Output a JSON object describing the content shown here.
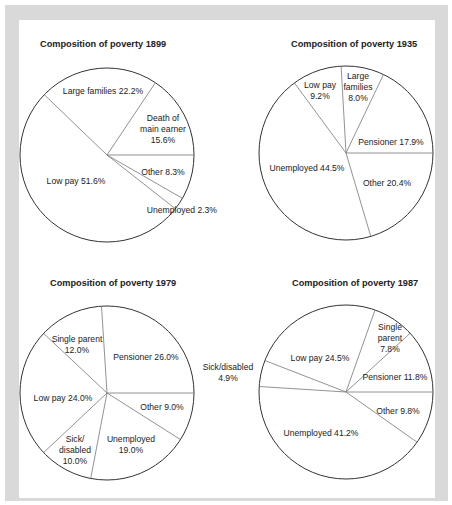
{
  "chart_data": [
    {
      "type": "pie",
      "title": "Composition of poverty 1899",
      "categories": [
        "Death of main earner",
        "Large families",
        "Low pay",
        "Unemployed",
        "Other"
      ],
      "values": [
        15.6,
        22.2,
        51.6,
        2.3,
        8.3
      ],
      "unit": "%",
      "layout": {
        "cx": 107,
        "cy": 155,
        "r": 87,
        "title_x": 40,
        "title_y": 47
      },
      "labels": [
        {
          "lines": [
            "Death of",
            "main earner",
            "15.6%"
          ],
          "x": 163,
          "y": 121
        },
        {
          "lines": [
            "Large families 22.2%"
          ],
          "x": 103,
          "y": 94
        },
        {
          "lines": [
            "Low pay 51.6%"
          ],
          "x": 76,
          "y": 184
        },
        {
          "lines": [
            "Unemployed 2.3%"
          ],
          "x": 217,
          "y": 213,
          "anchor": "end"
        },
        {
          "lines": [
            "Other 8.3%"
          ],
          "x": 163,
          "y": 175
        }
      ]
    },
    {
      "type": "pie",
      "title": "Composition of poverty 1935",
      "categories": [
        "Pensioner",
        "Large families",
        "Low pay",
        "Unemployed",
        "Other"
      ],
      "values": [
        17.9,
        8.0,
        9.2,
        44.5,
        20.4
      ],
      "unit": "%",
      "layout": {
        "cx": 346,
        "cy": 153,
        "r": 87,
        "title_x": 291,
        "title_y": 47
      },
      "labels": [
        {
          "lines": [
            "Pensioner 17.9%"
          ],
          "x": 391,
          "y": 145
        },
        {
          "lines": [
            "Large",
            "families",
            "8.0%"
          ],
          "x": 358,
          "y": 79
        },
        {
          "lines": [
            "Low pay",
            "9.2%"
          ],
          "x": 320,
          "y": 88
        },
        {
          "lines": [
            "Unemployed 44.5%"
          ],
          "x": 307,
          "y": 171
        },
        {
          "lines": [
            "Other 20.4%"
          ],
          "x": 387,
          "y": 186
        }
      ]
    },
    {
      "type": "pie",
      "title": "Composition of poverty 1979",
      "categories": [
        "Pensioner",
        "Single parent",
        "Low pay",
        "Sick/disabled",
        "Unemployed",
        "Other"
      ],
      "values": [
        26.0,
        12.0,
        24.0,
        10.0,
        19.0,
        9.0
      ],
      "unit": "%",
      "layout": {
        "cx": 107,
        "cy": 393,
        "r": 87,
        "title_x": 50,
        "title_y": 286
      },
      "labels": [
        {
          "lines": [
            "Single parent",
            "12.0%"
          ],
          "x": 77,
          "y": 342
        },
        {
          "lines": [
            "Pensioner 26.0%"
          ],
          "x": 146,
          "y": 360
        },
        {
          "lines": [
            "Low pay 24.0%"
          ],
          "x": 63,
          "y": 401
        },
        {
          "lines": [
            "Other 9.0%"
          ],
          "x": 162,
          "y": 410
        },
        {
          "lines": [
            "Sick/",
            "disabled",
            "10.0%"
          ],
          "x": 75,
          "y": 442
        },
        {
          "lines": [
            "Unemployed",
            "19.0%"
          ],
          "x": 131,
          "y": 442
        }
      ]
    },
    {
      "type": "pie",
      "title": "Composition of poverty 1987",
      "categories": [
        "Pensioner",
        "Single parent",
        "Low pay",
        "Sick/disabled",
        "Unemployed",
        "Other"
      ],
      "values": [
        11.8,
        7.8,
        24.5,
        4.9,
        41.2,
        9.8
      ],
      "unit": "%",
      "layout": {
        "cx": 346,
        "cy": 392,
        "r": 87,
        "title_x": 292,
        "title_y": 286
      },
      "labels": [
        {
          "lines": [
            "Single",
            "parent",
            "7.8%"
          ],
          "x": 390,
          "y": 330
        },
        {
          "lines": [
            "Low pay 24.5%"
          ],
          "x": 320,
          "y": 361
        },
        {
          "lines": [
            "Sick/disabled",
            "4.9%"
          ],
          "x": 228,
          "y": 370
        },
        {
          "lines": [
            "Pensioner 11.8%"
          ],
          "x": 395,
          "y": 380
        },
        {
          "lines": [
            "Other 9.8%"
          ],
          "x": 398,
          "y": 414
        },
        {
          "lines": [
            "Unemployed 41.2%"
          ],
          "x": 321,
          "y": 436
        }
      ]
    }
  ]
}
